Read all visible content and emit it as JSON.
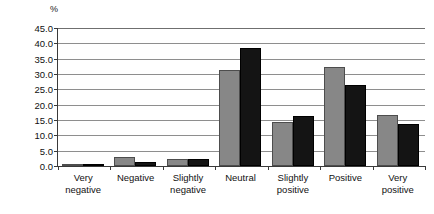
{
  "chart_data": {
    "type": "bar",
    "title": "",
    "xlabel": "",
    "ylabel": "%",
    "unit_label": "%",
    "categories": [
      "Very negative",
      "Negative",
      "Slightly negative",
      "Neutral",
      "Slightly positive",
      "Positive",
      "Very positive"
    ],
    "category_lines": [
      [
        "Very",
        "negative"
      ],
      [
        "Negative",
        ""
      ],
      [
        "Slightly",
        "negative"
      ],
      [
        "Neutral",
        ""
      ],
      [
        "Slightly",
        "positive"
      ],
      [
        "Positive",
        ""
      ],
      [
        "Very",
        "positive"
      ]
    ],
    "series": [
      {
        "name": "series-1",
        "color": "#878787",
        "values": [
          0.5,
          2.8,
          2.3,
          31.3,
          14.2,
          32.3,
          16.7
        ]
      },
      {
        "name": "series-2",
        "color": "#141414",
        "values": [
          0.8,
          1.3,
          2.3,
          38.6,
          16.2,
          26.5,
          13.7
        ]
      }
    ],
    "ylim": [
      0.0,
      45.0
    ],
    "ytick_step": 5.0,
    "yticks": [
      "0.0",
      "5.0",
      "10.0",
      "15.0",
      "20.0",
      "25.0",
      "30.0",
      "35.0",
      "40.0",
      "45.0"
    ],
    "grid": true,
    "legend": "none"
  }
}
